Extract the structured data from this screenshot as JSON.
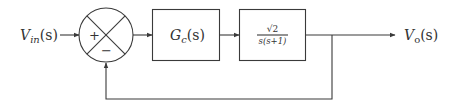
{
  "diagram": {
    "type": "feedback-control-block-diagram",
    "input": {
      "label_main": "V",
      "label_sub": "in",
      "label_arg": "(s)"
    },
    "output": {
      "label_main": "V",
      "label_sub": "o",
      "label_arg": "(s)"
    },
    "summing_junction": {
      "plus_sign": "+",
      "minus_sign": "−"
    },
    "blocks": [
      {
        "id": "controller",
        "label_main": "G",
        "label_sub": "c",
        "label_arg": "(s)"
      },
      {
        "id": "plant",
        "numerator": "√2",
        "denominator": "s(s+1)"
      }
    ],
    "feedback": {
      "type": "unity",
      "sign": "negative"
    }
  },
  "colors": {
    "line": "#3a3a3a",
    "text": "#333333",
    "background": "#ffffff"
  }
}
